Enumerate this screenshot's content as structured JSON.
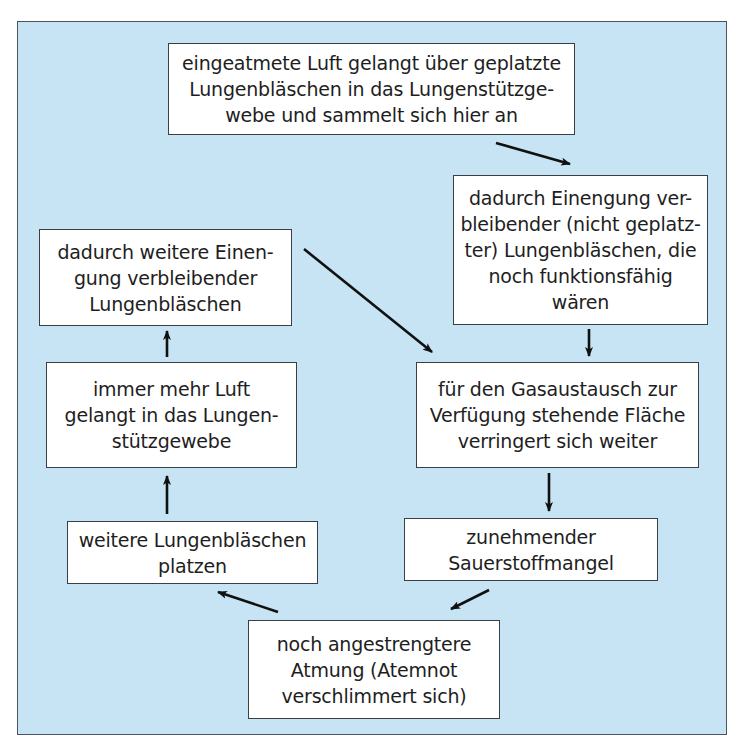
{
  "diagram": {
    "title": "",
    "background_color": "#c6e4f4",
    "box_color": "#ffffff",
    "arrow_color": "#111111",
    "nodes": [
      {
        "id": "n1",
        "label": "eingeatmete Luft gelangt über geplatzte\nLungenbläschen in das Lungenstützge-\nwebe und sammelt sich hier an"
      },
      {
        "id": "n2",
        "label": "dadurch Einengung ver-\nbleibender (nicht geplatz-\nter) Lungenbläschen, die\nnoch funktionsfähig\nwären"
      },
      {
        "id": "n3",
        "label": "für den Gasaustausch zur\nVerfügung stehende Fläche\nverringert sich weiter"
      },
      {
        "id": "n4",
        "label": "zunehmender\nSauerstoffmangel"
      },
      {
        "id": "n5",
        "label": "noch angestrengtere\nAtmung (Atemnot\nverschlimmert sich)"
      },
      {
        "id": "n6",
        "label": "weitere Lungenbläschen\nplatzen"
      },
      {
        "id": "n7",
        "label": "immer mehr Luft\ngelangt in das Lungen-\nstützgewebe"
      },
      {
        "id": "n8",
        "label": "dadurch weitere Einen-\ngung verbleibender\nLungenbläschen"
      }
    ],
    "edges": [
      {
        "from": "n1",
        "to": "n2"
      },
      {
        "from": "n2",
        "to": "n3"
      },
      {
        "from": "n3",
        "to": "n4"
      },
      {
        "from": "n4",
        "to": "n5"
      },
      {
        "from": "n5",
        "to": "n6"
      },
      {
        "from": "n6",
        "to": "n7"
      },
      {
        "from": "n7",
        "to": "n8"
      },
      {
        "from": "n8",
        "to": "n3"
      }
    ]
  }
}
